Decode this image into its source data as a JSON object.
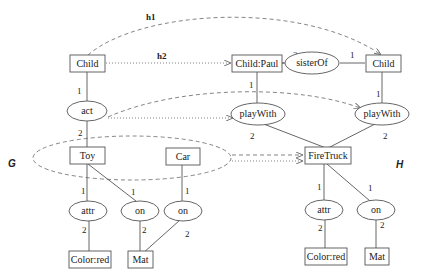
{
  "graph_labels": {
    "left": "G",
    "right": "H"
  },
  "mapping_labels": {
    "h1": "h1",
    "h2": "h2"
  },
  "graph_g": {
    "concepts": {
      "child": "Child",
      "toy": "Toy",
      "car": "Car",
      "color_red": "Color:red",
      "mat": "Mat"
    },
    "relations": {
      "act": "act",
      "attr": "attr",
      "on_toy": "on",
      "on_car": "on"
    },
    "edge_labels": {
      "child_act": "1",
      "act_toy": "2",
      "toy_attr": "1",
      "attr_color": "2",
      "toy_on": "1",
      "on_mat": "2",
      "car_on": "1",
      "on_car_mat": "2"
    }
  },
  "graph_h": {
    "concepts": {
      "child_paul": "Child:Paul",
      "child": "Child",
      "firetruck": "FireTruck",
      "color_red": "Color:red",
      "mat": "Mat"
    },
    "relations": {
      "sister_of": "sisterOf",
      "play_with_left": "playWith",
      "play_with_right": "playWith",
      "attr": "attr",
      "on": "on"
    },
    "edge_labels": {
      "paul_sister": "2",
      "sister_child": "1",
      "paul_playwith": "1",
      "child_playwith": "1",
      "playwith_left_fire": "2",
      "playwith_right_fire": "2",
      "fire_attr": "1",
      "attr_color": "2",
      "fire_on": "1",
      "on_mat": "2"
    }
  }
}
